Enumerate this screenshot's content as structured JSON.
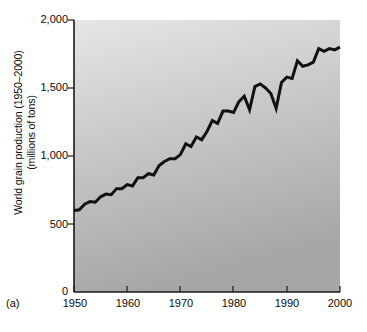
{
  "figure": {
    "panel_label": "(a)",
    "background_color": "#ffffff",
    "plot_gradient_top": "#e2e2e2",
    "plot_gradient_bottom": "#a8a8a8",
    "line_color": "#111111",
    "axis_color": "#1a1a1a"
  },
  "chart_data": {
    "type": "line",
    "title": "",
    "xlabel": "",
    "ylabel": "World grain production (1950–2000)\n(millions of tons)",
    "ylabel_line1": "World grain production (1950–2000)",
    "ylabel_line2": "(millions of tons)",
    "xlim": [
      1950,
      2000
    ],
    "ylim": [
      0,
      2000
    ],
    "grid": false,
    "legend": false,
    "yticks": [
      0,
      500,
      1000,
      1500,
      2000
    ],
    "ytick_labels": [
      "0",
      "500",
      "1,000",
      "1,500",
      "2,000"
    ],
    "xticks": [
      1950,
      1960,
      1970,
      1980,
      1990,
      2000
    ],
    "xtick_labels": [
      "1950",
      "1960",
      "1970",
      "1980",
      "1990",
      "2000"
    ],
    "series": [
      {
        "name": "World grain production",
        "units": "millions of tons",
        "x": [
          1950,
          1951,
          1952,
          1953,
          1954,
          1955,
          1956,
          1957,
          1958,
          1959,
          1960,
          1961,
          1962,
          1963,
          1964,
          1965,
          1966,
          1967,
          1968,
          1969,
          1970,
          1971,
          1972,
          1973,
          1974,
          1975,
          1976,
          1977,
          1978,
          1979,
          1980,
          1981,
          1982,
          1983,
          1984,
          1985,
          1986,
          1987,
          1988,
          1989,
          1990,
          1991,
          1992,
          1993,
          1994,
          1995,
          1996,
          1997,
          1998,
          1999,
          2000
        ],
        "values": [
          600,
          605,
          645,
          665,
          660,
          700,
          720,
          715,
          760,
          760,
          790,
          780,
          840,
          840,
          870,
          860,
          930,
          960,
          980,
          980,
          1010,
          1090,
          1070,
          1140,
          1120,
          1180,
          1260,
          1240,
          1330,
          1330,
          1320,
          1400,
          1440,
          1340,
          1510,
          1530,
          1500,
          1460,
          1350,
          1540,
          1580,
          1570,
          1700,
          1660,
          1670,
          1690,
          1790,
          1770,
          1790,
          1780,
          1800
        ]
      }
    ]
  }
}
